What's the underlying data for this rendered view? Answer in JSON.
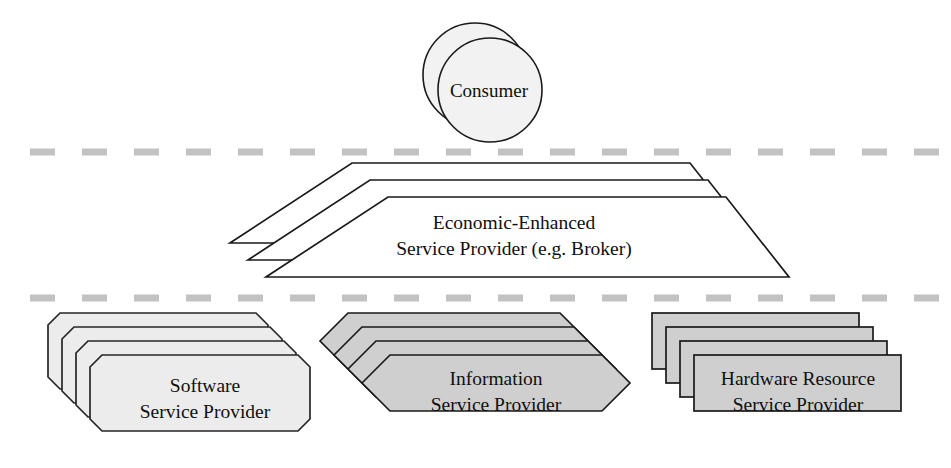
{
  "diagram": {
    "background_color": "#ffffff",
    "width": 951,
    "height": 468,
    "dividers": [
      {
        "name": "consumer-broker-divider",
        "y": 152,
        "color": "#c2c2c2",
        "style": "dashed"
      },
      {
        "name": "broker-provider-divider",
        "y": 298,
        "color": "#c2c2c2",
        "style": "dashed"
      }
    ],
    "layers": [
      {
        "id": "consumer",
        "shape": "circle-stack",
        "stack_count": 2,
        "fill": "#f2f2f2",
        "stroke": "#1a1a1a",
        "label_lines": [
          "Consumer"
        ]
      },
      {
        "id": "broker",
        "shape": "trapezoid-stack",
        "stack_count": 3,
        "fill": "#ffffff",
        "stroke": "#1a1a1a",
        "label_lines": [
          "Economic-Enhanced",
          "Service Provider (e.g. Broker)"
        ]
      },
      {
        "id": "software-service-provider",
        "shape": "octagon-stack",
        "stack_count": 4,
        "fill": "#ececec",
        "stroke": "#262626",
        "label_lines": [
          "Software",
          "Service Provider"
        ]
      },
      {
        "id": "information-service-provider",
        "shape": "hexagon-stack",
        "stack_count": 4,
        "fill": "#cfcfcf",
        "stroke": "#1a1a1a",
        "label_lines": [
          "Information",
          "Service Provider"
        ]
      },
      {
        "id": "hardware-resource-service-provider",
        "shape": "rectangle-stack",
        "stack_count": 4,
        "fill": "#cfcfcf",
        "stroke": "#1a1a1a",
        "label_lines": [
          "Hardware Resource",
          "Service Provider"
        ]
      }
    ],
    "labels": {
      "consumer": "Consumer",
      "broker_line1": "Economic-Enhanced",
      "broker_line2": "Service Provider (e.g. Broker)",
      "software_line1": "Software",
      "software_line2": "Service Provider",
      "information_line1": "Information",
      "information_line2": "Service Provider",
      "hardware_line1": "Hardware Resource",
      "hardware_line2": "Service Provider"
    }
  }
}
